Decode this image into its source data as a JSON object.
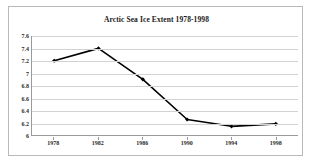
{
  "chart_data": {
    "type": "line",
    "title": "Arctic Sea Ice Extent 1978-1998",
    "xlabel": "",
    "ylabel": "",
    "categories": [
      "1978",
      "1982",
      "1986",
      "1990",
      "1994",
      "1998"
    ],
    "x": [
      1978,
      1982,
      1986,
      1990,
      1994,
      1998
    ],
    "values": [
      7.2,
      7.4,
      6.9,
      6.25,
      6.14,
      6.18
    ],
    "series": [
      {
        "name": "Arctic Sea Ice Extent",
        "values": [
          7.2,
          7.4,
          6.9,
          6.25,
          6.14,
          6.18
        ]
      }
    ],
    "ylim": [
      6,
      7.6
    ],
    "xlim": [
      1978,
      1998
    ],
    "ytick_labels": [
      "7.6",
      "7.4",
      "7.2",
      "7",
      "6.8",
      "6.6",
      "6.4",
      "6.2",
      "6"
    ],
    "ytick_values": [
      7.6,
      7.4,
      7.2,
      7,
      6.8,
      6.6,
      6.4,
      6.2,
      6
    ],
    "xtick_labels": [
      "1978",
      "1982",
      "1986",
      "1990",
      "1994",
      "1998"
    ],
    "grid": true,
    "grid_axis": "y",
    "legend": false,
    "legend_position": "none",
    "marker": "diamond",
    "line_color": "#000000",
    "marker_color": "#000000",
    "grid_color": "#d2d2d2",
    "axis_color": "#9a9a9a",
    "background_color": "#ffffff",
    "border_color": "#b9b9b9"
  }
}
